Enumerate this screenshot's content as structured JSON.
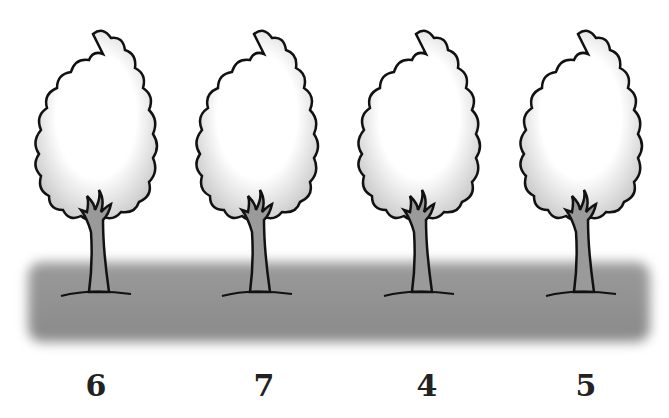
{
  "scene": {
    "description": "Four identical deciduous trees standing on a grey ground band, each with a number below",
    "trees": [
      {
        "label": "6",
        "x": 15
      },
      {
        "label": "7",
        "x": 176
      },
      {
        "label": "4",
        "x": 338
      },
      {
        "label": "5",
        "x": 500
      }
    ],
    "colors": {
      "ground": "#8f8f8f",
      "outline": "#111111",
      "trunk": "#9a9a9a",
      "crown_shade": "#cfcfcf"
    }
  }
}
